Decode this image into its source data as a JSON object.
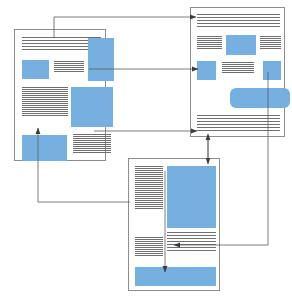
{
  "diagram": {
    "type": "node-link",
    "colors": {
      "image_block": "#76b0e0",
      "page_border": "#8d8d8d",
      "text_rule": "#6f6f6f",
      "connector": "#5a5a5a",
      "background": "#ffffff"
    },
    "nodes": [
      {
        "id": "page-left",
        "name": "page-thumbnail-left",
        "x": 14,
        "y": 29,
        "w": 92,
        "h": 132,
        "blocks": [
          {
            "kind": "lines",
            "x": 6,
            "y": 6,
            "w": 80,
            "h": 14,
            "count": 6
          },
          {
            "kind": "image",
            "x": 72,
            "y": 8,
            "w": 24,
            "h": 0,
            "note": "overlap-top-right"
          },
          {
            "kind": "image",
            "x": 72,
            "y": 8,
            "w": 0,
            "h": 0,
            "note": ""
          }
        ]
      },
      {
        "id": "page-right",
        "name": "page-thumbnail-right",
        "x": 190,
        "y": 7,
        "w": 95,
        "h": 130
      },
      {
        "id": "page-bottom",
        "name": "page-thumbnail-bottom",
        "x": 128,
        "y": 158,
        "w": 92,
        "h": 133
      }
    ],
    "edges": [
      {
        "id": "e1",
        "name": "edge-left-to-right-top",
        "from": "page-left",
        "to": "page-right",
        "label": "",
        "arrowheads": 1
      },
      {
        "id": "e2",
        "name": "edge-left-to-right-middle",
        "from": "page-left",
        "to": "page-right",
        "label": "",
        "arrowheads": 1
      },
      {
        "id": "e3",
        "name": "edge-left-to-right-lower",
        "from": "page-left",
        "to": "page-right",
        "label": "",
        "arrowheads": 1
      },
      {
        "id": "e4",
        "name": "edge-bottom-to-left",
        "from": "page-bottom",
        "to": "page-left",
        "label": "",
        "arrowheads": 1
      },
      {
        "id": "e5",
        "name": "edge-right-bottom-bidirectional",
        "from": "page-right",
        "to": "page-bottom",
        "label": "",
        "arrowheads": 2
      },
      {
        "id": "e6",
        "name": "edge-right-to-bottom-lower",
        "from": "page-right",
        "to": "page-bottom",
        "label": "",
        "arrowheads": 1
      },
      {
        "id": "e7",
        "name": "edge-internal-bottom-page",
        "from": "page-bottom",
        "to": "page-bottom",
        "label": "",
        "arrowheads": 1
      }
    ]
  },
  "page_left": {
    "name": "page-thumbnail-left",
    "frame": {
      "x": 14,
      "y": 29,
      "w": 92,
      "h": 132
    },
    "elements": [
      {
        "type": "text-lines",
        "name": "headline-lines",
        "x": 7,
        "y": 7,
        "w": 79,
        "h": 16,
        "count": 5,
        "gap": 3
      },
      {
        "type": "image",
        "name": "image-top-right",
        "x": 73,
        "y": 8,
        "w": 26,
        "h": 43
      },
      {
        "type": "image",
        "name": "image-left-small",
        "x": 7,
        "y": 28,
        "w": 27,
        "h": 19
      },
      {
        "type": "text-lines",
        "name": "column-lines-upper",
        "x": 39,
        "y": 29,
        "w": 30,
        "h": 19,
        "count": 6,
        "gap": 2
      },
      {
        "type": "text-lines",
        "name": "column-lines-left",
        "x": 7,
        "y": 55,
        "w": 46,
        "h": 44,
        "count": 12,
        "gap": 2
      },
      {
        "type": "image",
        "name": "image-center",
        "x": 56,
        "y": 57,
        "w": 42,
        "h": 40
      },
      {
        "type": "image",
        "name": "image-bottom-left",
        "x": 7,
        "y": 105,
        "w": 45,
        "h": 27
      },
      {
        "type": "text-lines",
        "name": "column-lines-bottom-right",
        "x": 58,
        "y": 104,
        "w": 38,
        "h": 30,
        "count": 9,
        "gap": 2
      }
    ]
  },
  "page_right": {
    "name": "page-thumbnail-right",
    "frame": {
      "x": 190,
      "y": 7,
      "w": 95,
      "h": 130
    },
    "elements": [
      {
        "type": "text-lines",
        "name": "headline-lines",
        "x": 6,
        "y": 6,
        "w": 83,
        "h": 16,
        "count": 5,
        "gap": 3
      },
      {
        "type": "text-lines",
        "name": "column-lines-left-upper",
        "x": 6,
        "y": 27,
        "w": 25,
        "h": 20,
        "count": 7,
        "gap": 2
      },
      {
        "type": "image",
        "name": "image-top-center",
        "x": 35,
        "y": 27,
        "w": 30,
        "h": 20
      },
      {
        "type": "text-lines",
        "name": "column-lines-right-upper",
        "x": 69,
        "y": 27,
        "w": 21,
        "h": 20,
        "count": 7,
        "gap": 2
      },
      {
        "type": "image",
        "name": "image-left-small",
        "x": 6,
        "y": 53,
        "w": 19,
        "h": 19
      },
      {
        "type": "text-lines",
        "name": "column-lines-center",
        "x": 31,
        "y": 53,
        "w": 32,
        "h": 20,
        "count": 6,
        "gap": 2
      },
      {
        "type": "image",
        "name": "image-right-small",
        "x": 72,
        "y": 53,
        "w": 18,
        "h": 19
      },
      {
        "type": "image",
        "name": "image-banner",
        "x": 39,
        "y": 80,
        "w": 60,
        "h": 20,
        "rounded": true
      },
      {
        "type": "text-lines",
        "name": "footer-lines",
        "x": 6,
        "y": 107,
        "w": 83,
        "h": 18,
        "count": 6,
        "gap": 3
      }
    ]
  },
  "page_bottom": {
    "name": "page-thumbnail-bottom",
    "frame": {
      "x": 128,
      "y": 158,
      "w": 92,
      "h": 133
    },
    "elements": [
      {
        "type": "text-lines",
        "name": "left-column-lines",
        "x": 6,
        "y": 7,
        "w": 28,
        "h": 68,
        "count": 22,
        "gap": 2
      },
      {
        "type": "image",
        "name": "image-main",
        "x": 38,
        "y": 7,
        "w": 49,
        "h": 62
      },
      {
        "type": "text-lines",
        "name": "left-column-lines-lower",
        "x": 6,
        "y": 78,
        "w": 28,
        "h": 30,
        "count": 10,
        "gap": 2
      },
      {
        "type": "text-lines",
        "name": "right-column-lines-lower",
        "x": 38,
        "y": 73,
        "w": 49,
        "h": 30,
        "count": 8,
        "gap": 3
      },
      {
        "type": "image",
        "name": "image-footer",
        "x": 6,
        "y": 108,
        "w": 81,
        "h": 19
      }
    ]
  }
}
